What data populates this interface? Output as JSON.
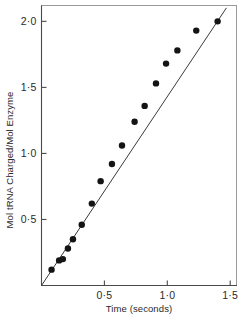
{
  "chart_data": {
    "type": "scatter",
    "title": "",
    "xlabel": "Time (seconds)",
    "ylabel": "Mol tRNA Charged/Mol Enzyme",
    "xlim": [
      0,
      1.55
    ],
    "ylim": [
      0,
      2.12
    ],
    "grid": false,
    "legend": null,
    "decimal_separator": "middle-dot",
    "x_ticks": [
      {
        "value": 0.5,
        "label": "0·5"
      },
      {
        "value": 1.0,
        "label": "1·0"
      },
      {
        "value": 1.5,
        "label": "1·5"
      }
    ],
    "y_ticks": [
      {
        "value": 0.5,
        "label": "0·5"
      },
      {
        "value": 1.0,
        "label": "1·0"
      },
      {
        "value": 1.5,
        "label": "1·5"
      },
      {
        "value": 2.0,
        "label": "2·0"
      }
    ],
    "series": [
      {
        "name": "tRNA charging",
        "marker": "filled-circle",
        "marker_color": "#141414",
        "points": [
          {
            "x": 0.08,
            "y": 0.12
          },
          {
            "x": 0.14,
            "y": 0.19
          },
          {
            "x": 0.17,
            "y": 0.2
          },
          {
            "x": 0.21,
            "y": 0.28
          },
          {
            "x": 0.25,
            "y": 0.35
          },
          {
            "x": 0.32,
            "y": 0.46
          },
          {
            "x": 0.4,
            "y": 0.62
          },
          {
            "x": 0.47,
            "y": 0.79
          },
          {
            "x": 0.56,
            "y": 0.92
          },
          {
            "x": 0.64,
            "y": 1.06
          },
          {
            "x": 0.74,
            "y": 1.24
          },
          {
            "x": 0.82,
            "y": 1.36
          },
          {
            "x": 0.91,
            "y": 1.53
          },
          {
            "x": 0.99,
            "y": 1.68
          },
          {
            "x": 1.08,
            "y": 1.78
          },
          {
            "x": 1.23,
            "y": 1.93
          },
          {
            "x": 1.4,
            "y": 2.0
          }
        ]
      }
    ],
    "fit_line": {
      "type": "linear",
      "slope": 1.43,
      "intercept": 0.0,
      "x_start": 0.0,
      "x_end": 1.47
    }
  },
  "axis_titles": {
    "x": "Time (seconds)",
    "y": "Mol tRNA Charged/Mol Enzyme"
  }
}
